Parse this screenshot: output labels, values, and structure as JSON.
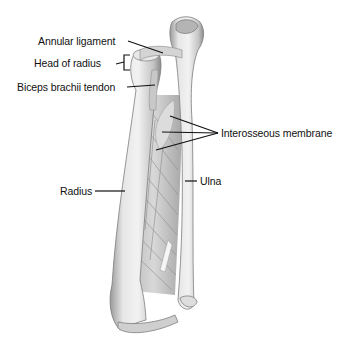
{
  "figure": {
    "labels": {
      "annular_ligament": "Annular ligament",
      "head_of_radius": "Head of radius",
      "biceps_brachii_tendon": "Biceps brachii tendon",
      "interosseous_membrane": "Interosseous membrane",
      "radius": "Radius",
      "ulna": "Ulna"
    },
    "colors": {
      "bone_light": "#ebebeb",
      "bone_mid": "#c9c9c9",
      "bone_dark": "#8e8e8e",
      "leader_line": "#111111",
      "background": "#ffffff"
    }
  }
}
